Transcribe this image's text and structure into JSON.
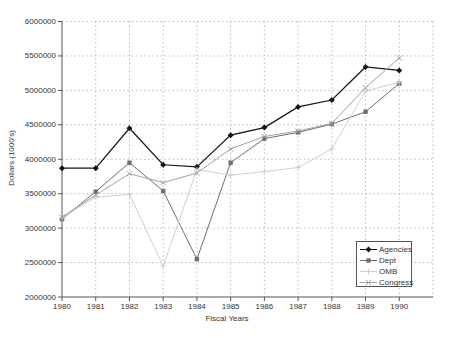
{
  "axes": {
    "ylabel": "Dollars (1000's)",
    "xlabel": "Fiscal Years"
  },
  "chart_data": {
    "type": "line",
    "title": "",
    "xlabel": "Fiscal Years",
    "ylabel": "Dollars (1000's)",
    "grid": true,
    "legend_position": "inside-bottom-right",
    "xlim": [
      1980,
      1991
    ],
    "ylim": [
      2000000,
      6000000
    ],
    "x": [
      1980,
      1981,
      1982,
      1983,
      1984,
      1985,
      1986,
      1987,
      1988,
      1989,
      1990
    ],
    "x_tick_labels": [
      "1980",
      "1981",
      "1982",
      "1983",
      "1984",
      "1985",
      "1986",
      "1987",
      "1988",
      "1989",
      "1990"
    ],
    "y_ticks": [
      2000000,
      2500000,
      3000000,
      3500000,
      4000000,
      4500000,
      5000000,
      5500000,
      6000000
    ],
    "y_tick_labels": [
      "2000000",
      "2500000",
      "3000000",
      "3500000",
      "4000000",
      "4500000",
      "5000000",
      "5500000",
      "6000000"
    ],
    "series": [
      {
        "name": "Agencies",
        "color": "#141414",
        "marker": "diamond",
        "line_width": 1.2,
        "values": [
          3870000,
          3870000,
          4450000,
          3920000,
          3890000,
          4350000,
          4460000,
          4760000,
          4860000,
          5340000,
          5290000
        ]
      },
      {
        "name": "Dept",
        "color": "#6f6f6f",
        "marker": "square",
        "line_width": 1,
        "values": [
          3130000,
          3530000,
          3950000,
          3540000,
          2550000,
          3950000,
          4300000,
          4390000,
          4510000,
          4690000,
          5100000
        ]
      },
      {
        "name": "OMB",
        "color": "#cfcfcf",
        "marker": "plus",
        "line_width": 1,
        "values": [
          3150000,
          3450000,
          3490000,
          2450000,
          3850000,
          3770000,
          3820000,
          3880000,
          4150000,
          4990000,
          5120000
        ]
      },
      {
        "name": "Congress",
        "color": "#a2a2a2",
        "marker": "x",
        "line_width": 1,
        "values": [
          3160000,
          3480000,
          3790000,
          3660000,
          3800000,
          4150000,
          4330000,
          4410000,
          4520000,
          5040000,
          5470000
        ]
      }
    ]
  }
}
